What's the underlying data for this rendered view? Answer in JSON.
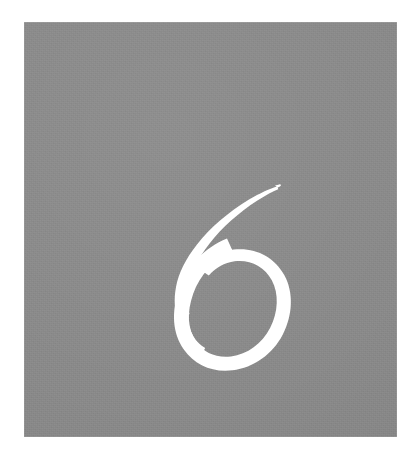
{
  "document": {
    "kind": "scanned-book-page",
    "page_background": "#ffffff"
  },
  "chapter_opener": {
    "block": {
      "name": "grey-panel",
      "fill_color": "#8a8a8a",
      "x": 24,
      "y": 22,
      "width": 373,
      "height": 415
    },
    "numeral": {
      "value": "6",
      "label": "Chapter 6",
      "color": "#ffffff",
      "style": "calligraphic-italic-serif",
      "x": 153,
      "y": 163,
      "width": 101,
      "height": 152
    }
  }
}
